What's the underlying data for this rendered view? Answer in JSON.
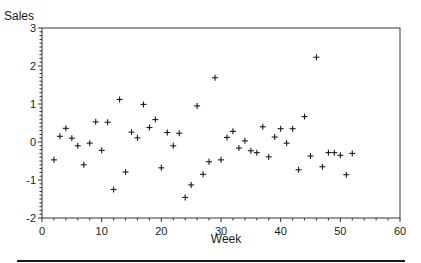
{
  "chart_data": {
    "type": "scatter",
    "title": "",
    "xlabel": "Week",
    "ylabel": "Sales",
    "xlim": [
      0,
      60
    ],
    "ylim": [
      -2,
      3
    ],
    "x_ticks": [
      0,
      10,
      20,
      30,
      40,
      50,
      60
    ],
    "y_ticks": [
      -2,
      -1,
      0,
      1,
      2,
      3
    ],
    "grid": false,
    "legend": null,
    "marker": "+",
    "series": [
      {
        "name": "Sales",
        "x": [
          2,
          3,
          4,
          5,
          6,
          7,
          8,
          9,
          10,
          11,
          12,
          13,
          14,
          15,
          16,
          17,
          18,
          19,
          20,
          21,
          22,
          23,
          24,
          25,
          26,
          27,
          28,
          29,
          30,
          31,
          32,
          33,
          34,
          35,
          36,
          37,
          38,
          39,
          40,
          41,
          42,
          43,
          44,
          45,
          46,
          47,
          48,
          49,
          50,
          51,
          52
        ],
        "y": [
          -0.47,
          0.15,
          0.36,
          0.1,
          -0.1,
          -0.6,
          -0.03,
          0.53,
          -0.22,
          0.52,
          -1.25,
          1.12,
          -0.79,
          0.26,
          0.11,
          0.99,
          0.38,
          0.59,
          -0.68,
          0.25,
          -0.1,
          0.23,
          -1.46,
          -1.13,
          0.95,
          -0.85,
          -0.52,
          1.69,
          -0.47,
          0.12,
          0.28,
          -0.16,
          0.03,
          -0.23,
          -0.28,
          0.4,
          -0.39,
          0.13,
          0.35,
          -0.03,
          0.35,
          -0.73,
          0.67,
          -0.37,
          2.23,
          -0.65,
          -0.28,
          -0.28,
          -0.35,
          -0.86,
          -0.3
        ]
      }
    ]
  },
  "labels": {
    "ylabel": "Sales",
    "xlabel": "Week"
  }
}
